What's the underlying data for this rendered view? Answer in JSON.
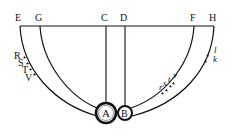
{
  "diagram": {
    "type": "geometric-figure",
    "top_line_labels": [
      "E",
      "G",
      "C",
      "D",
      "F",
      "H"
    ],
    "circles": [
      {
        "label": "A",
        "cx": 106,
        "cy": 113,
        "r": 10
      },
      {
        "label": "B",
        "cx": 125,
        "cy": 113,
        "r": 7
      }
    ],
    "left_arc_marks": [
      "R",
      "S",
      "T",
      "V"
    ],
    "right_inner_marks": [
      "r",
      "s",
      "t",
      "v"
    ],
    "right_outer_marks": [
      "l",
      "k"
    ],
    "stroke_color": "#111111",
    "background": "#ffffff"
  },
  "labels": {
    "E": "E",
    "G": "G",
    "C": "C",
    "D": "D",
    "F": "F",
    "H": "H",
    "A": "A",
    "B": "B",
    "R": "R",
    "S": "S",
    "T": "T",
    "V": "V",
    "r": "r",
    "s": "s",
    "t": "t",
    "v": "v",
    "l": "l",
    "k": "k"
  }
}
